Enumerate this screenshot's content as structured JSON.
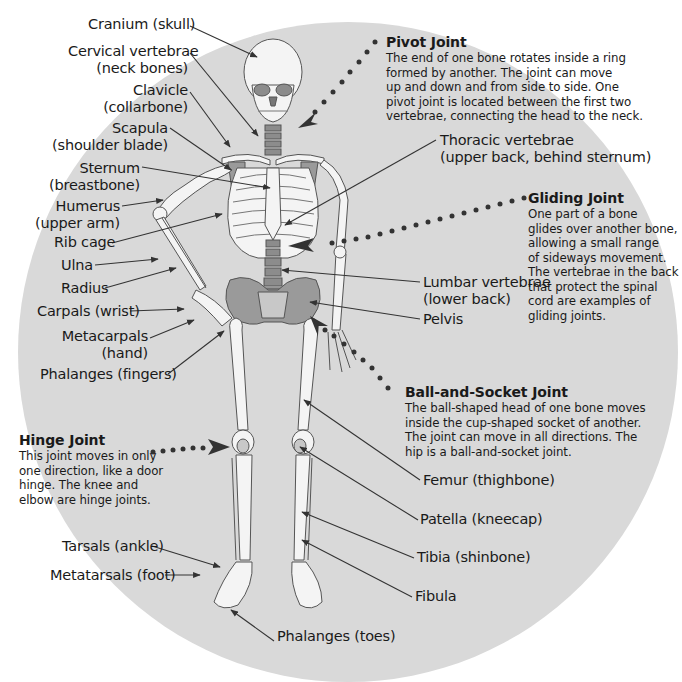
{
  "diagram": {
    "type": "labeled anatomical illustration",
    "colors": {
      "background_circle": "#d9d9d9",
      "bone_fill": "#f4f4f4",
      "bone_stroke": "#555555",
      "highlight_bone": "#8c8c8c",
      "leader_line": "#333333",
      "dot_pointer": "#333333"
    }
  },
  "labels_left": [
    {
      "id": "cranium",
      "text": "Cranium (skull)"
    },
    {
      "id": "cervical",
      "line1": "Cervical vertebrae",
      "line2": "(neck bones)"
    },
    {
      "id": "clavicle",
      "line1": "Clavicle",
      "line2": "(collarbone)"
    },
    {
      "id": "scapula",
      "line1": "Scapula",
      "line2": "(shoulder blade)"
    },
    {
      "id": "sternum",
      "line1": "Sternum",
      "line2": "(breastbone)"
    },
    {
      "id": "humerus",
      "line1": "Humerus",
      "line2": "(upper arm)"
    },
    {
      "id": "ribcage",
      "text": "Rib cage"
    },
    {
      "id": "ulna",
      "text": "Ulna"
    },
    {
      "id": "radius",
      "text": "Radius"
    },
    {
      "id": "carpals",
      "text": "Carpals (wrist)"
    },
    {
      "id": "metacarpals",
      "line1": "Metacarpals",
      "line2": "(hand)"
    },
    {
      "id": "phalanges_fingers",
      "text": "Phalanges (fingers)"
    },
    {
      "id": "tarsals",
      "text": "Tarsals (ankle)"
    },
    {
      "id": "metatarsals",
      "text": "Metatarsals (foot)"
    }
  ],
  "labels_right": [
    {
      "id": "thoracic",
      "line1": "Thoracic vertebrae",
      "line2": "(upper back, behind sternum)"
    },
    {
      "id": "lumbar",
      "line1": "Lumbar vertebrae",
      "line2": "(lower back)"
    },
    {
      "id": "pelvis",
      "text": "Pelvis"
    },
    {
      "id": "femur",
      "text": "Femur (thighbone)"
    },
    {
      "id": "patella",
      "text": "Patella (kneecap)"
    },
    {
      "id": "tibia",
      "text": "Tibia (shinbone)"
    },
    {
      "id": "fibula",
      "text": "Fibula"
    },
    {
      "id": "phalanges_toes",
      "text": "Phalanges (toes)"
    }
  ],
  "joints": [
    {
      "id": "pivot",
      "title": "Pivot Joint",
      "body": "The end of one bone rotates inside a ring\nformed by another. The joint can move\nup and down and from side to side. One\npivot joint is located between the first two\n vertebrae, connecting the head to the neck."
    },
    {
      "id": "gliding",
      "title": "Gliding Joint",
      "body": "One part of a bone\nglides over another bone,\nallowing a small range\nof sideways movement.\nThe vertebrae in the back\nthat protect the spinal\ncord are examples of\ngliding joints."
    },
    {
      "id": "ball_socket",
      "title": "Ball-and-Socket Joint",
      "body": "The ball-shaped head of one bone moves\ninside the cup-shaped socket of another.\nThe joint can move in all directions. The\nhip is a ball-and-socket joint."
    },
    {
      "id": "hinge",
      "title": "Hinge Joint",
      "body": "This joint moves in only\none direction, like a door\nhinge. The knee and\nelbow are hinge joints."
    }
  ]
}
